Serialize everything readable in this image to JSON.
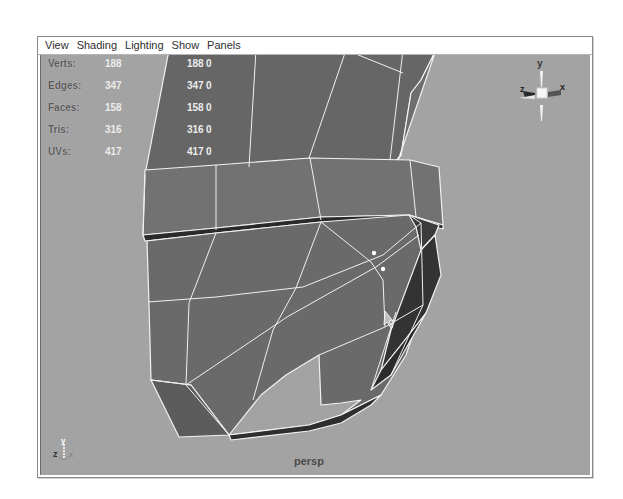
{
  "menubar": {
    "items": [
      {
        "label": "View"
      },
      {
        "label": "Shading"
      },
      {
        "label": "Lighting"
      },
      {
        "label": "Show"
      },
      {
        "label": "Panels"
      }
    ]
  },
  "hud": {
    "rows": [
      {
        "label": "Verts:",
        "v1": "188",
        "v2": "188",
        "v3": "0"
      },
      {
        "label": "Edges:",
        "v1": "347",
        "v2": "347",
        "v3": "0"
      },
      {
        "label": "Faces:",
        "v1": "158",
        "v2": "158",
        "v3": "0"
      },
      {
        "label": "Tris:",
        "v1": "316",
        "v2": "316",
        "v3": "0"
      },
      {
        "label": "UVs:",
        "v1": "417",
        "v2": "417",
        "v3": "0"
      }
    ]
  },
  "viewport": {
    "camera": "persp",
    "background_color": "#a3a3a3",
    "mesh_face_color": "#6a6a6a",
    "wire_color": "#f2f2f2"
  },
  "viewcube": {
    "axes": {
      "y": "y",
      "x": "x",
      "z": "z"
    }
  },
  "axis_gizmo": {
    "y": "y",
    "z": "z",
    "x": "x"
  }
}
